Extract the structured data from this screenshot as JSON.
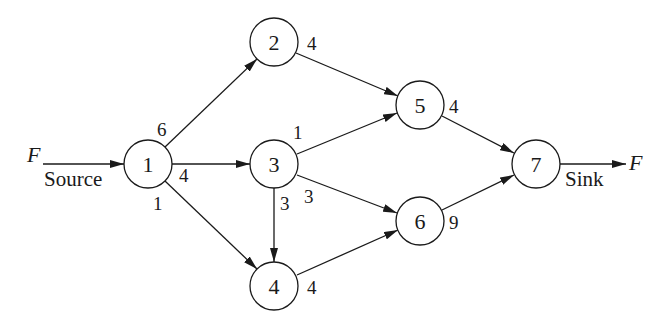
{
  "diagram": {
    "type": "directed-network",
    "colors": {
      "stroke": "#1a1a1a",
      "background": "#ffffff"
    },
    "source": {
      "flow_symbol": "F",
      "label": "Source"
    },
    "sink": {
      "flow_symbol": "F",
      "label": "Sink"
    },
    "nodes": [
      {
        "id": "1",
        "label": "1",
        "cx": 148,
        "cy": 164,
        "weight": ""
      },
      {
        "id": "2",
        "label": "2",
        "cx": 274,
        "cy": 42,
        "weight": "4"
      },
      {
        "id": "3",
        "label": "3",
        "cx": 274,
        "cy": 164,
        "weight": ""
      },
      {
        "id": "4",
        "label": "4",
        "cx": 274,
        "cy": 286,
        "weight": "4"
      },
      {
        "id": "5",
        "label": "5",
        "cx": 420,
        "cy": 105,
        "weight": "4"
      },
      {
        "id": "6",
        "label": "6",
        "cx": 420,
        "cy": 221,
        "weight": "9"
      },
      {
        "id": "7",
        "label": "7",
        "cx": 536,
        "cy": 164,
        "weight": ""
      }
    ],
    "edges": [
      {
        "from": "1",
        "to": "2",
        "label": "6"
      },
      {
        "from": "1",
        "to": "3",
        "label": "4"
      },
      {
        "from": "1",
        "to": "4",
        "label": "1"
      },
      {
        "from": "2",
        "to": "5",
        "label": ""
      },
      {
        "from": "3",
        "to": "5",
        "label": "1"
      },
      {
        "from": "3",
        "to": "6",
        "label": "3"
      },
      {
        "from": "3",
        "to": "4",
        "label": "3"
      },
      {
        "from": "4",
        "to": "6",
        "label": ""
      },
      {
        "from": "5",
        "to": "7",
        "label": ""
      },
      {
        "from": "6",
        "to": "7",
        "label": ""
      }
    ],
    "labels": {
      "n1": "1",
      "n2": "2",
      "n3": "3",
      "n4": "4",
      "n5": "5",
      "n6": "6",
      "n7": "7",
      "w2": "4",
      "w4": "4",
      "w5": "4",
      "w6": "9",
      "e12": "6",
      "e13": "4",
      "e14": "1",
      "e35": "1",
      "e34": "3",
      "e36": "3"
    }
  }
}
